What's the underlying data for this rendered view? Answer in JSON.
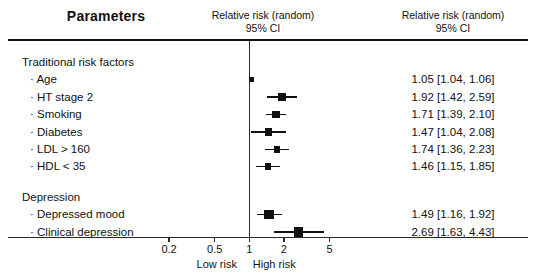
{
  "header": {
    "parameters_title": "Parameters",
    "middle_title_line1": "Relative risk (random)",
    "middle_title_line2": "95% CI",
    "right_title_line1": "Relative risk (random)",
    "right_title_line2": "95% CI"
  },
  "axis": {
    "label_low": "Low risk",
    "label_high": "High risk",
    "scale": "log",
    "ticks": [
      {
        "label": "0.2",
        "value": 0.2
      },
      {
        "label": "0.5",
        "value": 0.5
      },
      {
        "label": "1",
        "value": 1
      },
      {
        "label": "2",
        "value": 2
      },
      {
        "label": "5",
        "value": 5
      }
    ]
  },
  "groups": [
    {
      "name": "Traditional risk factors",
      "rows": [
        {
          "label": "Age",
          "estimate_text": "1.05 [1.04, 1.06]",
          "estimate": 1.05,
          "ci_low": 1.04,
          "ci_high": 1.06,
          "weight": "small"
        },
        {
          "label": "HT stage 2",
          "estimate_text": "1.92 [1.42, 2.59]",
          "estimate": 1.92,
          "ci_low": 1.42,
          "ci_high": 2.59,
          "weight": "medium"
        },
        {
          "label": "Smoking",
          "estimate_text": "1.71 [1.39, 2.10]",
          "estimate": 1.71,
          "ci_low": 1.39,
          "ci_high": 2.1,
          "weight": "medium"
        },
        {
          "label": "Diabetes",
          "estimate_text": "1.47 [1.04, 2.08]",
          "estimate": 1.47,
          "ci_low": 1.04,
          "ci_high": 2.08,
          "weight": "medium"
        },
        {
          "label": "LDL > 160",
          "estimate_text": "1.74 [1.36, 2.23]",
          "estimate": 1.74,
          "ci_low": 1.36,
          "ci_high": 2.23,
          "weight": "small-med"
        },
        {
          "label": "HDL < 35",
          "estimate_text": "1.46 [1.15, 1.85]",
          "estimate": 1.46,
          "ci_low": 1.15,
          "ci_high": 1.85,
          "weight": "small-med"
        }
      ]
    },
    {
      "name": "Depression",
      "rows": [
        {
          "label": "Depressed mood",
          "estimate_text": "1.49 [1.16, 1.92]",
          "estimate": 1.49,
          "ci_low": 1.16,
          "ci_high": 1.92,
          "weight": "large"
        },
        {
          "label": "Clinical depression",
          "estimate_text": "2.69 [1.63, 4.43]",
          "estimate": 2.69,
          "ci_low": 1.63,
          "ci_high": 4.43,
          "weight": "large"
        }
      ]
    }
  ],
  "chart_data": {
    "type": "forest",
    "title": "Relative risk (random) 95% CI",
    "xlabel": "Relative risk (random) 95% CI",
    "ylabel": "",
    "xscale": "log",
    "xlim": [
      0.2,
      6.0
    ],
    "xticks": [
      0.2,
      0.5,
      1,
      2,
      5
    ],
    "xticklabels": [
      "0.2",
      "0.5",
      "1",
      "2",
      "5"
    ],
    "reference_line": 1,
    "grid": false,
    "legend": "none",
    "annotations": [
      "Low risk",
      "High risk"
    ],
    "categories": [
      "Age",
      "HT stage 2",
      "Smoking",
      "Diabetes",
      "LDL > 160",
      "HDL < 35",
      "Depressed mood",
      "Clinical depression"
    ],
    "group_labels": [
      "Traditional risk factors",
      "Depression"
    ],
    "values": [
      1.05,
      1.92,
      1.71,
      1.47,
      1.74,
      1.46,
      1.49,
      2.69
    ],
    "ci_low": [
      1.04,
      1.42,
      1.39,
      1.04,
      1.36,
      1.15,
      1.16,
      1.63
    ],
    "ci_high": [
      1.06,
      2.59,
      2.1,
      2.08,
      2.23,
      1.85,
      1.92,
      4.43
    ]
  }
}
